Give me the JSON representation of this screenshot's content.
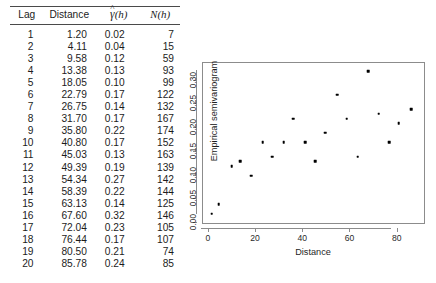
{
  "table": {
    "headers": {
      "lag": "Lag",
      "distance": "Distance",
      "gamma_symbol": "γ",
      "gamma_hat": "^",
      "gamma_arg": "(h)",
      "n_symbol": "N",
      "n_arg": "(h)"
    },
    "rows": [
      {
        "lag": "1",
        "distance": "1.20",
        "gamma": "0.02",
        "n": "7"
      },
      {
        "lag": "2",
        "distance": "4.11",
        "gamma": "0.04",
        "n": "15"
      },
      {
        "lag": "3",
        "distance": "9.58",
        "gamma": "0.12",
        "n": "59"
      },
      {
        "lag": "4",
        "distance": "13.38",
        "gamma": "0.13",
        "n": "93"
      },
      {
        "lag": "5",
        "distance": "18.05",
        "gamma": "0.10",
        "n": "99"
      },
      {
        "lag": "6",
        "distance": "22.79",
        "gamma": "0.17",
        "n": "122"
      },
      {
        "lag": "7",
        "distance": "26.75",
        "gamma": "0.14",
        "n": "132"
      },
      {
        "lag": "8",
        "distance": "31.70",
        "gamma": "0.17",
        "n": "167"
      },
      {
        "lag": "9",
        "distance": "35.80",
        "gamma": "0.22",
        "n": "174"
      },
      {
        "lag": "10",
        "distance": "40.80",
        "gamma": "0.17",
        "n": "152"
      },
      {
        "lag": "11",
        "distance": "45.03",
        "gamma": "0.13",
        "n": "163"
      },
      {
        "lag": "12",
        "distance": "49.39",
        "gamma": "0.19",
        "n": "139"
      },
      {
        "lag": "13",
        "distance": "54.34",
        "gamma": "0.27",
        "n": "142"
      },
      {
        "lag": "14",
        "distance": "58.39",
        "gamma": "0.22",
        "n": "144"
      },
      {
        "lag": "15",
        "distance": "63.13",
        "gamma": "0.14",
        "n": "125"
      },
      {
        "lag": "16",
        "distance": "67.60",
        "gamma": "0.32",
        "n": "146"
      },
      {
        "lag": "17",
        "distance": "72.04",
        "gamma": "0.23",
        "n": "105"
      },
      {
        "lag": "18",
        "distance": "76.44",
        "gamma": "0.17",
        "n": "107"
      },
      {
        "lag": "19",
        "distance": "80.50",
        "gamma": "0.21",
        "n": "74"
      },
      {
        "lag": "20",
        "distance": "85.78",
        "gamma": "0.24",
        "n": "85"
      }
    ]
  },
  "chart_data": {
    "type": "scatter",
    "title": "",
    "xlabel": "Distance",
    "ylabel": "Empirical semivariogram",
    "xlim": [
      -2.5,
      92.0
    ],
    "ylim": [
      -0.004,
      0.337
    ],
    "xticks": [
      0,
      20,
      40,
      60,
      80
    ],
    "xtick_labels": [
      "0",
      "20",
      "40",
      "60",
      "80"
    ],
    "yticks": [
      0.0,
      0.05,
      0.1,
      0.15,
      0.2,
      0.25,
      0.3
    ],
    "ytick_labels": [
      "0.00",
      "0.05",
      "0.10",
      "0.15",
      "0.20",
      "0.25",
      "0.30"
    ],
    "grid": false,
    "legend": false,
    "marker_color": "#000000",
    "frame_color": "#8c8c8c",
    "x": [
      1.2,
      4.11,
      9.58,
      13.38,
      18.05,
      22.79,
      26.75,
      31.7,
      35.8,
      40.8,
      45.03,
      49.39,
      54.34,
      58.39,
      63.13,
      67.6,
      72.04,
      76.44,
      80.5,
      85.78
    ],
    "y": [
      0.02,
      0.04,
      0.12,
      0.13,
      0.1,
      0.17,
      0.14,
      0.17,
      0.22,
      0.17,
      0.13,
      0.19,
      0.27,
      0.22,
      0.14,
      0.32,
      0.23,
      0.17,
      0.21,
      0.24
    ]
  }
}
